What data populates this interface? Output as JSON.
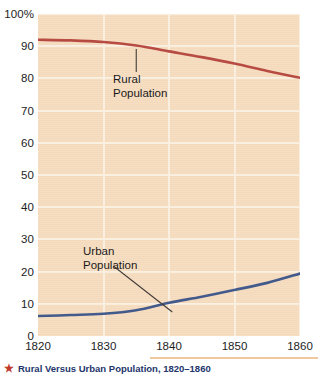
{
  "caption": {
    "bullet": "★",
    "text": "Rural Versus Urban Population, 1820–1860"
  },
  "colors": {
    "rural_line": "#b5453c",
    "urban_line": "#3a5489",
    "plot_background": "#f6dcc0",
    "gridline": "#fbf0e2",
    "caption_text": "#23356b",
    "caption_star": "#c0392b"
  },
  "annotations": {
    "rural": "Rural\nPopulation",
    "urban": "Urban\nPopulation"
  },
  "axis": {
    "y_ticks": [
      "100%",
      "90",
      "80",
      "70",
      "60",
      "50",
      "40",
      "30",
      "20",
      "10",
      "0"
    ],
    "x_ticks": [
      "1820",
      "1830",
      "1840",
      "1850",
      "1860"
    ]
  },
  "chart_data": {
    "type": "line",
    "title": "Rural Versus Urban Population, 1820–1860",
    "xlabel": "",
    "ylabel": "",
    "xlim": [
      1820,
      1860
    ],
    "ylim": [
      0,
      100
    ],
    "grid": true,
    "legend": "inline-annotations",
    "x": [
      1820,
      1825,
      1830,
      1835,
      1840,
      1845,
      1850,
      1855,
      1860
    ],
    "series": [
      {
        "name": "Rural Population",
        "color": "#b5453c",
        "values": [
          92.0,
          91.8,
          91.3,
          90.2,
          88.4,
          86.6,
          84.6,
          82.3,
          80.2
        ]
      },
      {
        "name": "Urban Population",
        "color": "#3a5489",
        "values": [
          6.2,
          6.5,
          6.9,
          8.0,
          10.3,
          12.2,
          14.3,
          16.5,
          19.4
        ]
      }
    ],
    "y_ticks": [
      0,
      10,
      20,
      30,
      40,
      50,
      60,
      70,
      80,
      90,
      100
    ],
    "x_ticks": [
      1820,
      1830,
      1840,
      1850,
      1860
    ]
  }
}
